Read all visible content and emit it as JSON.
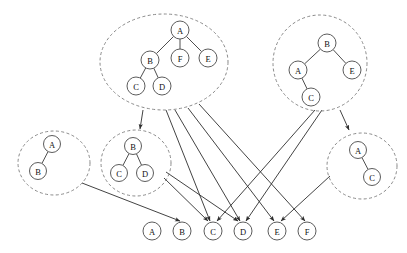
{
  "diagram": {
    "canvas": {
      "width": 407,
      "height": 253
    },
    "styles": {
      "cluster_stroke": "#8a8a8a",
      "node_stroke": "#4a4a4a",
      "node_fill": "#ffffff",
      "edge_stroke": "#2e2e2e",
      "label_color": "#111111"
    },
    "clusters": [
      {
        "id": "cluster-top-left",
        "name": "top-left-tree-cluster",
        "ellipse": {
          "cx": 164,
          "cy": 62,
          "rx": 64,
          "ry": 48
        },
        "nodes": [
          {
            "id": "tl-A",
            "label": "A",
            "cx": 180,
            "cy": 30,
            "r": 9
          },
          {
            "id": "tl-B",
            "label": "B",
            "cx": 150,
            "cy": 60,
            "r": 9
          },
          {
            "id": "tl-F",
            "label": "F",
            "cx": 180,
            "cy": 58,
            "r": 9
          },
          {
            "id": "tl-E",
            "label": "E",
            "cx": 208,
            "cy": 58,
            "r": 9
          },
          {
            "id": "tl-C",
            "label": "C",
            "cx": 136,
            "cy": 86,
            "r": 9
          },
          {
            "id": "tl-D",
            "label": "D",
            "cx": 162,
            "cy": 86,
            "r": 9
          }
        ],
        "edges": [
          {
            "from": "tl-A",
            "to": "tl-B"
          },
          {
            "from": "tl-A",
            "to": "tl-F"
          },
          {
            "from": "tl-A",
            "to": "tl-E"
          },
          {
            "from": "tl-B",
            "to": "tl-C"
          },
          {
            "from": "tl-B",
            "to": "tl-D"
          }
        ]
      },
      {
        "id": "cluster-top-right",
        "name": "top-right-tree-cluster",
        "ellipse": {
          "cx": 320,
          "cy": 63,
          "rx": 47,
          "ry": 48
        },
        "nodes": [
          {
            "id": "tr-B",
            "label": "B",
            "cx": 327,
            "cy": 43,
            "r": 9
          },
          {
            "id": "tr-A",
            "label": "A",
            "cx": 298,
            "cy": 70,
            "r": 9
          },
          {
            "id": "tr-E",
            "label": "E",
            "cx": 352,
            "cy": 70,
            "r": 9
          },
          {
            "id": "tr-C",
            "label": "C",
            "cx": 311,
            "cy": 97,
            "r": 9
          }
        ],
        "edges": [
          {
            "from": "tr-B",
            "to": "tr-A"
          },
          {
            "from": "tr-B",
            "to": "tr-E"
          },
          {
            "from": "tr-A",
            "to": "tr-C"
          }
        ]
      },
      {
        "id": "cluster-mid-left",
        "name": "mid-left-tree-cluster",
        "ellipse": {
          "cx": 54,
          "cy": 163,
          "rx": 36,
          "ry": 32
        },
        "nodes": [
          {
            "id": "ml-A",
            "label": "A",
            "cx": 52,
            "cy": 144,
            "r": 8.5
          },
          {
            "id": "ml-B",
            "label": "B",
            "cx": 38,
            "cy": 171,
            "r": 8.5
          }
        ],
        "edges": [
          {
            "from": "ml-A",
            "to": "ml-B"
          }
        ]
      },
      {
        "id": "cluster-mid-center",
        "name": "mid-center-tree-cluster",
        "ellipse": {
          "cx": 136,
          "cy": 163,
          "rx": 35,
          "ry": 33
        },
        "nodes": [
          {
            "id": "mc-B",
            "label": "B",
            "cx": 133,
            "cy": 146,
            "r": 8.5
          },
          {
            "id": "mc-C",
            "label": "C",
            "cx": 119,
            "cy": 173,
            "r": 8.5
          },
          {
            "id": "mc-D",
            "label": "D",
            "cx": 145,
            "cy": 173,
            "r": 8.5
          }
        ],
        "edges": [
          {
            "from": "mc-B",
            "to": "mc-C"
          },
          {
            "from": "mc-B",
            "to": "mc-D"
          }
        ]
      },
      {
        "id": "cluster-mid-right",
        "name": "mid-right-tree-cluster",
        "ellipse": {
          "cx": 362,
          "cy": 166,
          "rx": 35,
          "ry": 33
        },
        "nodes": [
          {
            "id": "mr-A",
            "label": "A",
            "cx": 358,
            "cy": 150,
            "r": 8.5
          },
          {
            "id": "mr-C",
            "label": "C",
            "cx": 372,
            "cy": 177,
            "r": 8.5
          }
        ],
        "edges": [
          {
            "from": "mr-A",
            "to": "mr-C"
          }
        ]
      }
    ],
    "bottom_nodes": [
      {
        "id": "bn-A",
        "label": "A",
        "cx": 152,
        "cy": 231,
        "r": 9
      },
      {
        "id": "bn-B",
        "label": "B",
        "cx": 182,
        "cy": 231,
        "r": 9
      },
      {
        "id": "bn-C",
        "label": "C",
        "cx": 213,
        "cy": 231,
        "r": 9
      },
      {
        "id": "bn-D",
        "label": "D",
        "cx": 243,
        "cy": 231,
        "r": 9
      },
      {
        "id": "bn-E",
        "label": "E",
        "cx": 277,
        "cy": 231,
        "r": 9
      },
      {
        "id": "bn-F",
        "label": "F",
        "cx": 307,
        "cy": 231,
        "r": 9
      }
    ],
    "mapping_edges": [
      {
        "name": "edge-topleft-to-midcenter",
        "x1": 143,
        "y1": 110,
        "x2": 140,
        "y2": 129,
        "arrow": true
      },
      {
        "name": "edge-topleft-to-C",
        "x1": 166,
        "y1": 110,
        "x2": 210,
        "y2": 221,
        "arrow": true
      },
      {
        "name": "edge-topleft-to-D",
        "x1": 175,
        "y1": 110,
        "x2": 240,
        "y2": 221,
        "arrow": true
      },
      {
        "name": "edge-topleft-to-E",
        "x1": 188,
        "y1": 108,
        "x2": 274,
        "y2": 221,
        "arrow": true
      },
      {
        "name": "edge-topleft-to-F",
        "x1": 199,
        "y1": 104,
        "x2": 305,
        "y2": 221,
        "arrow": true
      },
      {
        "name": "edge-topright-to-midright",
        "x1": 340,
        "y1": 110,
        "x2": 349,
        "y2": 130,
        "arrow": true
      },
      {
        "name": "edge-topright-to-C",
        "x1": 315,
        "y1": 110,
        "x2": 217,
        "y2": 221,
        "arrow": true
      },
      {
        "name": "edge-topright-to-D",
        "x1": 322,
        "y1": 110,
        "x2": 246,
        "y2": 221,
        "arrow": true
      },
      {
        "name": "edge-midleft-to-B",
        "x1": 82,
        "y1": 183,
        "x2": 180,
        "y2": 221,
        "arrow": true
      },
      {
        "name": "edge-midcenter-to-C",
        "x1": 164,
        "y1": 178,
        "x2": 208,
        "y2": 221,
        "arrow": true
      },
      {
        "name": "edge-midcenter-to-D",
        "x1": 166,
        "y1": 172,
        "x2": 238,
        "y2": 221,
        "arrow": true
      },
      {
        "name": "edge-midright-to-E",
        "x1": 330,
        "y1": 176,
        "x2": 281,
        "y2": 221,
        "arrow": true
      }
    ]
  }
}
